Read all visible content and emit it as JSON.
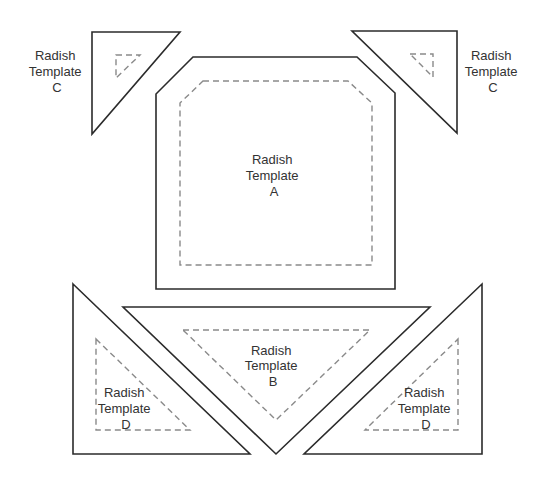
{
  "diagram": {
    "type": "quilt-pattern-templates",
    "colors": {
      "cut_line": "#2b2b2b",
      "seam_line": "#8a8a8a",
      "text": "#333333",
      "background": "#ffffff"
    },
    "pieces": [
      {
        "id": "A",
        "shape": "octagon",
        "label": [
          "Radish",
          "Template",
          "A"
        ]
      },
      {
        "id": "B",
        "shape": "triangle",
        "label": [
          "Radish",
          "Template",
          "B"
        ]
      },
      {
        "id": "C-left",
        "shape": "triangle",
        "label": [
          "Radish",
          "Template",
          "C"
        ]
      },
      {
        "id": "C-right",
        "shape": "triangle",
        "label": [
          "Radish",
          "Template",
          "C"
        ]
      },
      {
        "id": "D-left",
        "shape": "triangle",
        "label": [
          "Radish",
          "Template",
          "D"
        ]
      },
      {
        "id": "D-right",
        "shape": "triangle",
        "label": [
          "Radish",
          "Template",
          "D"
        ]
      }
    ]
  }
}
